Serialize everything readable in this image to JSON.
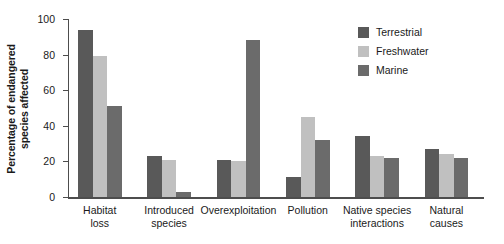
{
  "chart_data": {
    "type": "bar",
    "title": "",
    "xlabel": "",
    "ylabel": "Percentage of endangered species affected",
    "ylim": [
      0,
      100
    ],
    "yticks": [
      0,
      20,
      40,
      60,
      80,
      100
    ],
    "grid": false,
    "legend_position": "top-right",
    "categories": [
      "Habitat loss",
      "Introduced species",
      "Overexploitation",
      "Pollution",
      "Native species interactions",
      "Natural causes"
    ],
    "category_lines": [
      [
        "Habitat",
        "loss"
      ],
      [
        "Introduced",
        "species"
      ],
      [
        "Overexploitation"
      ],
      [
        "Pollution"
      ],
      [
        "Native species",
        "interactions"
      ],
      [
        "Natural",
        "causes"
      ]
    ],
    "series": [
      {
        "name": "Terrestrial",
        "color": "#595959",
        "values": [
          94,
          23,
          21,
          11,
          34,
          27
        ]
      },
      {
        "name": "Freshwater",
        "color": "#c0c0c0",
        "values": [
          79,
          21,
          20,
          45,
          23,
          24
        ]
      },
      {
        "name": "Marine",
        "color": "#6b6b6b",
        "values": [
          51,
          3,
          88,
          32,
          22,
          22
        ]
      }
    ]
  },
  "axis": {
    "ytick_labels": [
      "0",
      "20",
      "40",
      "60",
      "80",
      "100"
    ]
  },
  "legend": {
    "items": [
      {
        "label": "Terrestrial",
        "color": "#595959"
      },
      {
        "label": "Freshwater",
        "color": "#c0c0c0"
      },
      {
        "label": "Marine",
        "color": "#6b6b6b"
      }
    ]
  }
}
